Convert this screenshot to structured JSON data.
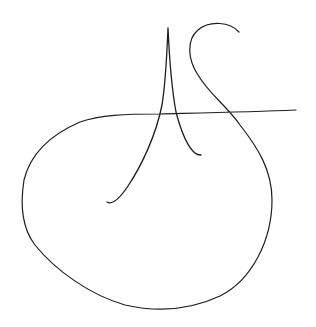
{
  "signature": {
    "description": "Handwritten signature with initials resembling 'A' and 'S' with a large looping underline",
    "ink_color": "#1e1e1e",
    "background_color": "#ffffff",
    "strokes": [
      {
        "name": "a-stroke",
        "width": 1.3,
        "d": "M107,202 C112,205 120,198 128,186 C142,165 156,135 162,105 C166,80 167,50 168,28 C169,50 171,85 176,112 C182,135 189,148 195,153 C197,155 199,155 201,155"
      },
      {
        "name": "s-loop-stroke",
        "width": 1.2,
        "d": "M239,32 C230,22 210,20 198,30 C186,40 188,60 198,75 C210,95 226,105 240,125 C258,148 272,170 272,200 C272,240 252,280 220,296 C190,310 160,313 125,305 C90,295 55,270 35,245 C22,228 20,205 24,180 C30,155 50,135 80,122 C100,115 125,114 160,114 C200,113 250,112 296,110"
      }
    ]
  }
}
